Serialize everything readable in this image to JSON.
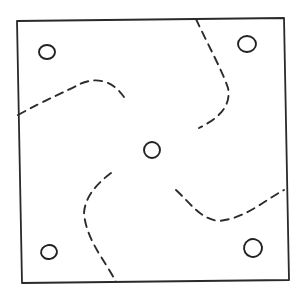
{
  "diagram": {
    "title": "Square plate with four corner holes, central hole, and four curved dashed cut lines",
    "stroke_color": "#2a2a2a",
    "background_color": "#ffffff",
    "elements": {
      "frame": {
        "kind": "square-outline",
        "style": "solid"
      },
      "holes": [
        {
          "id": "top-left",
          "kind": "circle"
        },
        {
          "id": "top-right",
          "kind": "circle"
        },
        {
          "id": "center",
          "kind": "circle"
        },
        {
          "id": "bottom-left",
          "kind": "circle"
        },
        {
          "id": "bottom-right",
          "kind": "circle"
        }
      ],
      "cut_lines": [
        {
          "id": "top-left",
          "kind": "curve",
          "style": "dashed"
        },
        {
          "id": "top-right",
          "kind": "curve",
          "style": "dashed"
        },
        {
          "id": "bottom-left",
          "kind": "curve",
          "style": "dashed"
        },
        {
          "id": "bottom-right",
          "kind": "curve",
          "style": "dashed"
        }
      ]
    }
  }
}
